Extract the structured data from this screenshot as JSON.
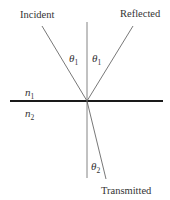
{
  "diagram": {
    "labels": {
      "incident": "Incident",
      "reflected": "Reflected",
      "transmitted": "Transmitted"
    },
    "media": {
      "upper": {
        "symbol": "n",
        "subscript": "1"
      },
      "lower": {
        "symbol": "n",
        "subscript": "2"
      }
    },
    "angles": {
      "incident": {
        "symbol": "θ",
        "subscript": "1"
      },
      "reflected": {
        "symbol": "θ",
        "subscript": "1"
      },
      "transmitted": {
        "symbol": "θ",
        "subscript": "2"
      }
    },
    "colors": {
      "ray": "#555555",
      "interface": "#1a1a1a",
      "text": "#333333"
    }
  }
}
